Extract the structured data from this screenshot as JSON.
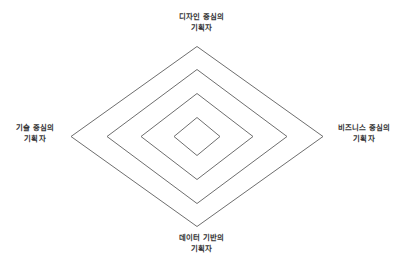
{
  "figure": {
    "background_color": "#ffffff",
    "line_color": "#6e6e6e",
    "text_color": "#333333"
  },
  "chart_data": {
    "type": "diagram",
    "shape": "nested-diamonds",
    "title": "",
    "center": {
      "x": 197,
      "y": 136.5
    },
    "rings": [
      {
        "index": 1,
        "half_width": 23,
        "half_height": 19
      },
      {
        "index": 2,
        "half_width": 56,
        "half_height": 43
      },
      {
        "index": 3,
        "half_width": 90,
        "half_height": 67
      },
      {
        "index": 4,
        "half_width": 126,
        "half_height": 90
      }
    ],
    "axes": [
      {
        "position": "top",
        "label_line1": "디자인 중심의",
        "label_line2": "기획자"
      },
      {
        "position": "right",
        "label_line1": "비즈니스 중심의",
        "label_line2": "기획자"
      },
      {
        "position": "bottom",
        "label_line1": "데이터 기반의",
        "label_line2": "기획자"
      },
      {
        "position": "left",
        "label_line1": "기술 중심의",
        "label_line2": "기획자"
      }
    ],
    "legend": [],
    "grid": false
  },
  "labels": {
    "top": {
      "line1": "디자인 중심의",
      "line2": "기획자"
    },
    "right": {
      "line1": "비즈니스 중심의",
      "line2": "기획자"
    },
    "bottom": {
      "line1": "데이터 기반의",
      "line2": "기획자"
    },
    "left": {
      "line1": "기술 중심의",
      "line2": "기획자"
    }
  }
}
